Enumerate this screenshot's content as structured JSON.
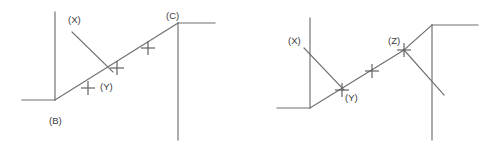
{
  "figure": {
    "background_color": "#ffffff",
    "stroke_color": "#6e6e6e",
    "label_color": "#3a3a3a",
    "tick_glyph": "plus-cross",
    "width": 485,
    "height": 148
  },
  "diagrams": [
    {
      "id": "left-diagram",
      "name": "diagram-left",
      "labels": {
        "x": "(X)",
        "y": "(Y)",
        "b": "(B)",
        "c": "(C)"
      },
      "label_positions": {
        "x": {
          "x": 68,
          "y": 23
        },
        "y": {
          "x": 100,
          "y": 90
        },
        "b": {
          "x": 49,
          "y": 124
        },
        "c": {
          "x": 166,
          "y": 19
        }
      },
      "tick_count": 3,
      "ticks": [
        {
          "x": 88,
          "y": 88
        },
        {
          "x": 117,
          "y": 68
        },
        {
          "x": 148,
          "y": 48
        }
      ],
      "segments": [
        {
          "name": "horizontal-base-left",
          "x1": 22,
          "y1": 100,
          "x2": 55,
          "y2": 100
        },
        {
          "name": "vertical-left-b",
          "x1": 55,
          "y1": 12,
          "x2": 55,
          "y2": 100
        },
        {
          "name": "diagonal-rising-b-to-c",
          "x1": 55,
          "y1": 100,
          "x2": 178,
          "y2": 23
        },
        {
          "name": "diagonal-x-descending",
          "x1": 72,
          "y1": 32,
          "x2": 113,
          "y2": 72
        },
        {
          "name": "vertical-right-c",
          "x1": 178,
          "y1": 23,
          "x2": 178,
          "y2": 140
        },
        {
          "name": "horizontal-top-right",
          "x1": 178,
          "y1": 23,
          "x2": 215,
          "y2": 23
        }
      ]
    },
    {
      "id": "right-diagram",
      "name": "diagram-right",
      "labels": {
        "x": "(X)",
        "y": "(Y)",
        "z": "(Z)"
      },
      "label_positions": {
        "x": {
          "x": 288,
          "y": 44
        },
        "y": {
          "x": 345,
          "y": 101
        },
        "z": {
          "x": 388,
          "y": 44
        }
      },
      "tick_count": 3,
      "ticks": [
        {
          "x": 342,
          "y": 90
        },
        {
          "x": 372,
          "y": 71
        },
        {
          "x": 404,
          "y": 50
        }
      ],
      "segments": [
        {
          "name": "horizontal-base-left",
          "x1": 277,
          "y1": 108,
          "x2": 310,
          "y2": 108
        },
        {
          "name": "vertical-left",
          "x1": 310,
          "y1": 18,
          "x2": 310,
          "y2": 108
        },
        {
          "name": "diagonal-rising-base-to-z",
          "x1": 310,
          "y1": 108,
          "x2": 404,
          "y2": 50
        },
        {
          "name": "diagonal-x-descending",
          "x1": 304,
          "y1": 48,
          "x2": 344,
          "y2": 90
        },
        {
          "name": "diagonal-z-to-corner",
          "x1": 404,
          "y1": 50,
          "x2": 432,
          "y2": 25
        },
        {
          "name": "horizontal-top-right",
          "x1": 432,
          "y1": 25,
          "x2": 478,
          "y2": 25
        },
        {
          "name": "vertical-right",
          "x1": 432,
          "y1": 25,
          "x2": 432,
          "y2": 140
        },
        {
          "name": "diagonal-z-descending",
          "x1": 404,
          "y1": 50,
          "x2": 444,
          "y2": 95
        }
      ]
    }
  ]
}
